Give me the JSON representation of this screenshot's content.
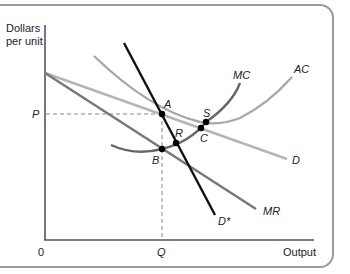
{
  "diagram": {
    "y_axis_label_line1": "Dollars",
    "y_axis_label_line2": "per unit",
    "x_axis_label": "Output",
    "origin_label": "0",
    "price_label": "P",
    "quantity_label": "Q",
    "curves": {
      "ac": "AC",
      "mc": "MC",
      "d": "D",
      "mr": "MR",
      "dstar": "D*"
    },
    "points": {
      "a": "A",
      "b": "B",
      "r": "R",
      "c": "C",
      "s": "S"
    },
    "colors": {
      "axis": "#555555",
      "dstar": "#111111",
      "mc": "#666666",
      "mr": "#777777",
      "ac": "#a8a8a8",
      "d": "#b5b5b5",
      "frame": "#9a9a9a"
    }
  }
}
